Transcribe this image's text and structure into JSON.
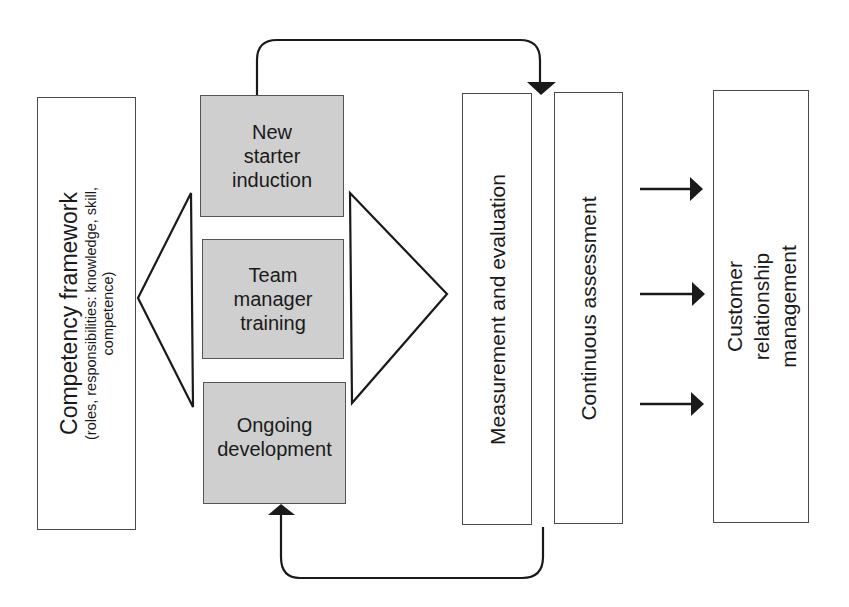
{
  "diagram": {
    "left_box": {
      "title": "Competency framework",
      "subtitle_line1": "(roles, responsibilities: knowledge, skill,",
      "subtitle_line2": "competence)"
    },
    "center_boxes": [
      {
        "label": "New\nstarter\ninduction"
      },
      {
        "label": "Team\nmanager\ntraining"
      },
      {
        "label": "Ongoing\ndevelopment"
      }
    ],
    "measurement_box": {
      "label": "Measurement and evaluation"
    },
    "assessment_box": {
      "label": "Continuous assessment"
    },
    "crm_box": {
      "label": "Customer relationship\nmanagement"
    },
    "colors": {
      "stroke": "#1a1a1a",
      "box_border": "#4a4a4a",
      "grey_fill": "#cfcfcf",
      "background": "#ffffff"
    }
  }
}
